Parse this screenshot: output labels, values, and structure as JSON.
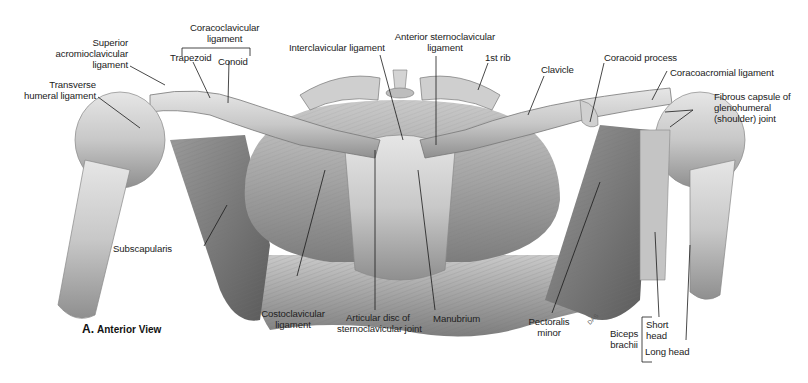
{
  "figure": {
    "panel_letter": "A.",
    "caption": "Anterior View",
    "structure": "Sternoclavicular and shoulder joints",
    "colors": {
      "background": "#ffffff",
      "label_text": "#222222",
      "leader_line": "#1a1a1a",
      "tissue_light": "#d9d9d9",
      "tissue_mid": "#a8a8a8",
      "tissue_dark": "#5e5e5e"
    }
  },
  "labels": {
    "coracoclavicular": "Coracoclavicular ligament",
    "coracoclavicular_l1": "Coracoclavicular",
    "coracoclavicular_l2": "ligament",
    "trapezoid": "Trapezoid",
    "conoid": "Conoid",
    "sup_acromio_l1": "Superior",
    "sup_acromio_l2": "acromioclavicular",
    "sup_acromio_l3": "ligament",
    "transverse_l1": "Transverse",
    "transverse_l2": "humeral ligament",
    "interclavicular": "Interclavicular ligament",
    "ant_sterno_l1": "Anterior sternoclavicular",
    "ant_sterno_l2": "ligament",
    "first_rib": "1st rib",
    "clavicle": "Clavicle",
    "coracoid_process": "Coracoid process",
    "coracoacromial": "Coracoacromial ligament",
    "fibrous_l1": "Fibrous capsule of",
    "fibrous_l2": "glenohumeral",
    "fibrous_l3": "(shoulder) joint",
    "subscapularis": "Subscapularis",
    "costoclavicular_l1": "Costoclavicular",
    "costoclavicular_l2": "ligament",
    "articular_l1": "Articular disc of",
    "articular_l2": "sternoclavicular joint",
    "manubrium": "Manubrium",
    "pectoralis_l1": "Pectoralis",
    "pectoralis_l2": "minor",
    "biceps_l1": "Biceps",
    "biceps_l2": "brachii",
    "short_head_l1": "Short",
    "short_head_l2": "head",
    "long_head": "Long head",
    "artist_signature": "DAS"
  }
}
